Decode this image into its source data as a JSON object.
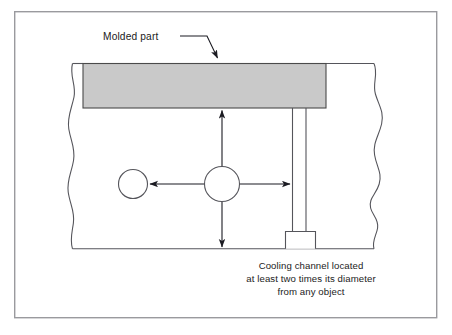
{
  "figure": {
    "kind": "engineering-cross-section-diagram",
    "background_color": "#ffffff",
    "frame": {
      "name": "outer-border",
      "stroke_color": "#9a9a9e",
      "stroke_width": 1.4,
      "x": 14,
      "y": 11,
      "width": 423,
      "height": 307
    },
    "labels": {
      "molded_part": {
        "text": "Molded part",
        "x": 103,
        "y": 40,
        "anchor": "start"
      }
    },
    "caption": {
      "lines": [
        "Cooling channel located",
        "at least two times its diameter",
        "from any object"
      ],
      "center_x": 311,
      "first_line_y": 269,
      "line_height": 13,
      "anchor": "middle"
    },
    "colors": {
      "molded_part_fill": "#c9c9c9",
      "molded_part_stroke": "#4a4a4a",
      "mold_outline_stroke": "#55555b",
      "arrow_stroke": "#1b1b22",
      "circle_stroke": "#55555b",
      "text_color": "#1b1b22",
      "frame_stroke": "#9a9a9e"
    },
    "geometry": {
      "mold_body": {
        "name": "mold-block",
        "top_y": 63,
        "bottom_y": 249,
        "left_break_x": 72,
        "right_break_x": 374
      },
      "molded_part_rect": {
        "x": 83,
        "y": 63,
        "width": 243,
        "height": 45
      },
      "center_circle": {
        "cx": 222,
        "cy": 184,
        "r": 17.5
      },
      "left_circle": {
        "cx": 133,
        "cy": 184,
        "r": 14.5
      },
      "cooling_channel": {
        "left_x": 292,
        "right_x": 306,
        "top_y": 108,
        "bottom_y": 231
      },
      "channel_base_box": {
        "x": 285,
        "y": 231,
        "width": 30,
        "height": 18
      },
      "arrows": {
        "up": {
          "x1": 222,
          "y1": 166,
          "x2": 222,
          "y2": 109
        },
        "down": {
          "x1": 222,
          "y1": 202,
          "x2": 222,
          "y2": 248
        },
        "left": {
          "x1": 204,
          "y1": 184,
          "x2": 149,
          "y2": 184
        },
        "right": {
          "x1": 240,
          "y1": 184,
          "x2": 291,
          "y2": 184
        }
      },
      "leader_line": {
        "name": "molded-part-leader",
        "points": "180,36 207,36 218,60"
      }
    }
  }
}
